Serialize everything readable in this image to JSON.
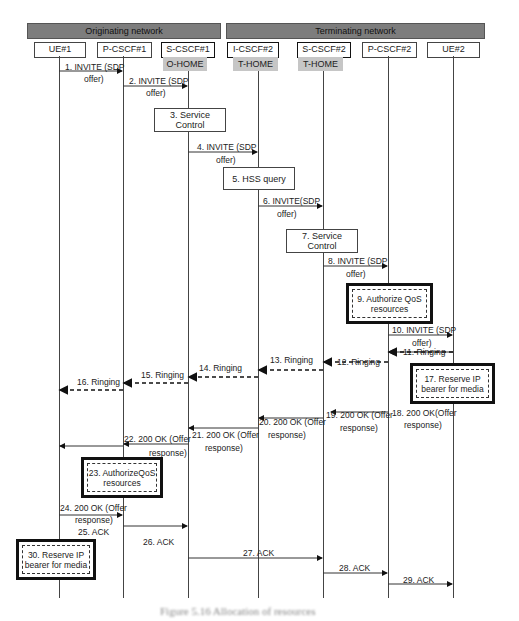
{
  "networks": {
    "originating": "Originating network",
    "terminating": "Terminating network"
  },
  "entities": [
    {
      "id": "ue1",
      "label": "UE#1",
      "x": 59
    },
    {
      "id": "pcscf1",
      "label": "P-CSCF#1",
      "x": 123
    },
    {
      "id": "scscf1",
      "label": "S-CSCF#1",
      "x": 188,
      "home": "O-HOME"
    },
    {
      "id": "icscf2",
      "label": "I-CSCF#2",
      "x": 258,
      "home": "T-HOME"
    },
    {
      "id": "scscf2",
      "label": "S-CSCF#2",
      "x": 323,
      "home": "T-HOME"
    },
    {
      "id": "pcscf2",
      "label": "P-CSCF#2",
      "x": 388
    },
    {
      "id": "ue2",
      "label": "UE#2",
      "x": 453
    }
  ],
  "messages": [
    {
      "n": "1",
      "line1": "1. INVITE (SDP",
      "line2": "offer)",
      "from": "ue1",
      "to": "pcscf1",
      "style": "solid"
    },
    {
      "n": "2",
      "line1": "2. INVITE (SDP",
      "line2": "offer)",
      "from": "pcscf1",
      "to": "scscf1",
      "style": "solid"
    },
    {
      "n": "4",
      "line1": "4. INVITE (SDP",
      "line2": "offer)",
      "from": "scscf1",
      "to": "icscf2",
      "style": "solid"
    },
    {
      "n": "6",
      "line1": "6. INVITE(SDP",
      "line2": "offer)",
      "from": "icscf2",
      "to": "scscf2",
      "style": "solid"
    },
    {
      "n": "8",
      "line1": "8. INVITE (SDP",
      "line2": "offer)",
      "from": "scscf2",
      "to": "pcscf2",
      "style": "solid"
    },
    {
      "n": "10",
      "line1": "10. INVITE (SDP",
      "line2": "offer)",
      "from": "pcscf2",
      "to": "ue2",
      "style": "solid"
    },
    {
      "n": "11",
      "line1": "11. Ringing",
      "from": "ue2",
      "to": "pcscf2",
      "style": "dashed"
    },
    {
      "n": "12",
      "line1": "12. Ringing",
      "from": "pcscf2",
      "to": "scscf2",
      "style": "dashed"
    },
    {
      "n": "13",
      "line1": "13. Ringing",
      "from": "scscf2",
      "to": "icscf2",
      "style": "dashed"
    },
    {
      "n": "14",
      "line1": "14. Ringing",
      "from": "icscf2",
      "to": "scscf1",
      "style": "dashed"
    },
    {
      "n": "15",
      "line1": "15. Ringing",
      "from": "scscf1",
      "to": "pcscf1",
      "style": "dashed"
    },
    {
      "n": "16",
      "line1": "16. Ringing",
      "from": "pcscf1",
      "to": "ue1",
      "style": "dashed"
    },
    {
      "n": "18",
      "line1": "18. 200 OK(Offer",
      "line2": "response)",
      "from": "ue2",
      "to": "pcscf2",
      "style": "solid"
    },
    {
      "n": "19",
      "line1": "19. 200 OK (Offer",
      "line2": "response)",
      "from": "pcscf2",
      "to": "scscf2",
      "style": "solid"
    },
    {
      "n": "20",
      "line1": "20. 200 OK (Offer",
      "line2": "response)",
      "from": "scscf2",
      "to": "icscf2",
      "style": "solid"
    },
    {
      "n": "21",
      "line1": "21. 200 OK (Offer",
      "line2": "response)",
      "from": "icscf2",
      "to": "scscf1",
      "style": "solid"
    },
    {
      "n": "22",
      "line1": "22. 200 OK (Offer",
      "line2": "response)",
      "from": "scscf1",
      "to": "pcscf1",
      "style": "solid"
    },
    {
      "n": "24",
      "line1": "24. 200 OK (Offer",
      "line2": "response)",
      "from": "pcscf1",
      "to": "ue1",
      "style": "solid"
    },
    {
      "n": "25",
      "line1": "25. ACK",
      "from": "ue1",
      "to": "pcscf1",
      "style": "solid"
    },
    {
      "n": "26",
      "line1": "26. ACK",
      "from": "pcscf1",
      "to": "scscf1",
      "style": "solid"
    },
    {
      "n": "27",
      "line1": "27. ACK",
      "from": "scscf1",
      "to": "scscf2",
      "style": "solid"
    },
    {
      "n": "28",
      "line1": "28. ACK",
      "from": "scscf2",
      "to": "pcscf2",
      "style": "solid"
    },
    {
      "n": "29",
      "line1": "29. ACK",
      "from": "pcscf2",
      "to": "ue2",
      "style": "solid"
    }
  ],
  "actions": [
    {
      "n": "3",
      "label": "3. Service Control",
      "at": "scscf1"
    },
    {
      "n": "5",
      "label": "5. HSS query",
      "at": "icscf2"
    },
    {
      "n": "7",
      "label": "7. Service Control",
      "at": "scscf2"
    }
  ],
  "highlighted_actions": [
    {
      "n": "9",
      "line1": "9. Authorize QoS",
      "line2": "resources",
      "at": "pcscf2"
    },
    {
      "n": "17",
      "line1": "17. Reserve IP",
      "line2": "bearer for media",
      "at": "ue2"
    },
    {
      "n": "23",
      "line1": "23. AuthorizeQoS",
      "line2": "resources",
      "at": "pcscf1"
    },
    {
      "n": "30",
      "line1": "30. Reserve IP",
      "line2": "bearer for media",
      "at": "ue1"
    }
  ],
  "caption": "Figure 5.16  Allocation of resources"
}
